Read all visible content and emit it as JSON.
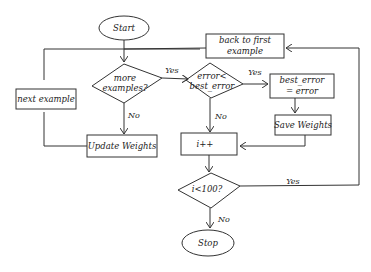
{
  "diagram": {
    "type": "flowchart",
    "style": "hand-drawn",
    "nodes": {
      "start": {
        "shape": "ellipse",
        "label": "Start"
      },
      "more_examples": {
        "shape": "diamond",
        "label_line1": "more",
        "label_line2": "examples?"
      },
      "error_check": {
        "shape": "diamond",
        "label_line1": "error<",
        "label_line2": "best_error"
      },
      "best_error_assign": {
        "shape": "rect",
        "label_line1": "best_error",
        "label_line2": "= error"
      },
      "save_weights": {
        "shape": "rect",
        "label": "Save Weights"
      },
      "next_example": {
        "shape": "rect",
        "label": "next example"
      },
      "update_weights": {
        "shape": "rect",
        "label": "Update Weights"
      },
      "back_to_first": {
        "shape": "rect",
        "label_line1": "back to first",
        "label_line2": "example"
      },
      "increment": {
        "shape": "rect",
        "label": "i++"
      },
      "loop_check": {
        "shape": "diamond",
        "label": "i<100?"
      },
      "stop": {
        "shape": "ellipse",
        "label": "Stop"
      }
    },
    "edge_labels": {
      "more_yes": "Yes",
      "more_no": "No",
      "err_yes": "Yes",
      "err_no": "No",
      "loop_yes": "Yes",
      "loop_no": "No"
    },
    "stroke_color": "#333333"
  }
}
